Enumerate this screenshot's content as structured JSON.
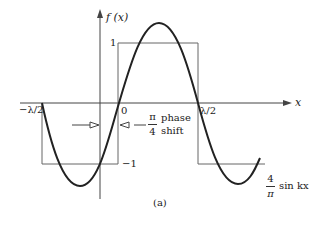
{
  "figure": {
    "caption": "(a)",
    "y_axis_label": "f (x)",
    "x_axis_label": "x",
    "tick_labels": {
      "top": "1",
      "bottom": "−1",
      "origin": "0",
      "left_half_wavelength": "−λ/2",
      "right_half_wavelength": "λ/2"
    },
    "phase_shift": {
      "numerator": "π",
      "denominator": "4",
      "text_line1": "phase",
      "text_line2": "shift"
    },
    "curve_label": {
      "numerator": "4",
      "denominator": "π",
      "text": "sin kx"
    },
    "series": [
      {
        "name": "square-wave",
        "description": "square wave of amplitude 1, shifted",
        "color": "#555555"
      },
      {
        "name": "sine-wave",
        "description": "(4/π) sin kx",
        "color": "#222222"
      }
    ]
  }
}
